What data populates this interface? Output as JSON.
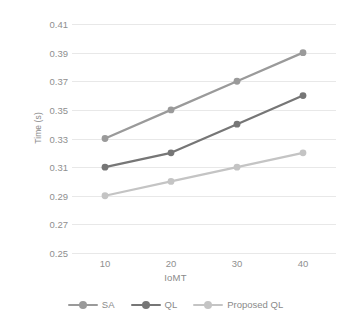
{
  "chart_data": {
    "type": "line",
    "title": "",
    "xlabel": "IoMT",
    "ylabel": "Time (s)",
    "x": [
      10,
      20,
      30,
      40
    ],
    "xtick_labels": [
      "10",
      "20",
      "30",
      "40"
    ],
    "ylim": [
      0.25,
      0.41
    ],
    "ytick_labels": [
      "0.41",
      "0.39",
      "0.37",
      "0.35",
      "0.33",
      "0.31",
      "0.29",
      "0.27",
      "0.25"
    ],
    "ytick_values": [
      0.41,
      0.39,
      0.37,
      0.35,
      0.33,
      0.31,
      0.29,
      0.27,
      0.25
    ],
    "grid": true,
    "legend_position": "bottom",
    "series": [
      {
        "name": "SA",
        "values": [
          0.33,
          0.35,
          0.37,
          0.39
        ],
        "color": "#9a9a9a"
      },
      {
        "name": "QL",
        "values": [
          0.31,
          0.32,
          0.34,
          0.36
        ],
        "color": "#767676"
      },
      {
        "name": "Proposed QL",
        "values": [
          0.29,
          0.3,
          0.31,
          0.32
        ],
        "color": "#c4c4c4"
      }
    ]
  },
  "legend": {
    "items": [
      {
        "label": "SA"
      },
      {
        "label": "QL"
      },
      {
        "label": "Proposed QL"
      }
    ]
  },
  "colors": {
    "gridline": "#e8e8e8",
    "text": "#8a8a8a",
    "background": "#ffffff"
  }
}
